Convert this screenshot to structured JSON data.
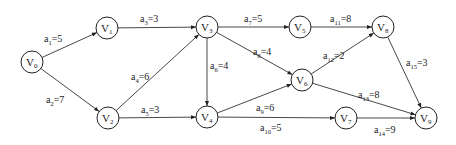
{
  "diagram": {
    "type": "aoe-network",
    "node_radius": 11,
    "colors": {
      "stroke": "#222222",
      "background": "#ffffff",
      "text": "#222222"
    },
    "nodes": [
      {
        "id": "V0",
        "base": "V",
        "sub": "0",
        "x": 32,
        "y": 62
      },
      {
        "id": "V1",
        "base": "V",
        "sub": "1",
        "x": 107,
        "y": 28
      },
      {
        "id": "V2",
        "base": "V",
        "sub": "2",
        "x": 108,
        "y": 118
      },
      {
        "id": "V3",
        "base": "V",
        "sub": "3",
        "x": 207,
        "y": 27
      },
      {
        "id": "V4",
        "base": "V",
        "sub": "4",
        "x": 207,
        "y": 117
      },
      {
        "id": "V5",
        "base": "V",
        "sub": "5",
        "x": 300,
        "y": 27
      },
      {
        "id": "V6",
        "base": "V",
        "sub": "6",
        "x": 302,
        "y": 80
      },
      {
        "id": "V7",
        "base": "V",
        "sub": "7",
        "x": 346,
        "y": 118
      },
      {
        "id": "V8",
        "base": "V",
        "sub": "8",
        "x": 383,
        "y": 27
      },
      {
        "id": "V9",
        "base": "V",
        "sub": "9",
        "x": 426,
        "y": 118
      }
    ],
    "edges": [
      {
        "from": "V0",
        "to": "V1",
        "base": "a",
        "sub": "1",
        "value": "5",
        "lx": 44,
        "ly": 42
      },
      {
        "from": "V0",
        "to": "V2",
        "base": "a",
        "sub": "2",
        "value": "7",
        "lx": 46,
        "ly": 103
      },
      {
        "from": "V1",
        "to": "V3",
        "base": "a",
        "sub": "3",
        "value": "3",
        "lx": 140,
        "ly": 22
      },
      {
        "from": "V2",
        "to": "V3",
        "base": "a",
        "sub": "4",
        "value": "6",
        "lx": 131,
        "ly": 80
      },
      {
        "from": "V2",
        "to": "V4",
        "base": "a",
        "sub": "5",
        "value": "3",
        "lx": 141,
        "ly": 113
      },
      {
        "from": "V3",
        "to": "V4",
        "base": "a",
        "sub": "6",
        "value": "4",
        "lx": 210,
        "ly": 69
      },
      {
        "from": "V3",
        "to": "V5",
        "base": "a",
        "sub": "7",
        "value": "5",
        "lx": 244,
        "ly": 22
      },
      {
        "from": "V3",
        "to": "V6",
        "base": "a",
        "sub": "8",
        "value": "4",
        "lx": 253,
        "ly": 55
      },
      {
        "from": "V4",
        "to": "V6",
        "base": "a",
        "sub": "9",
        "value": "6",
        "lx": 256,
        "ly": 111
      },
      {
        "from": "V4",
        "to": "V7",
        "base": "a",
        "sub": "10",
        "value": "5",
        "lx": 260,
        "ly": 131
      },
      {
        "from": "V5",
        "to": "V8",
        "base": "a",
        "sub": "11",
        "value": "8",
        "lx": 330,
        "ly": 22
      },
      {
        "from": "V6",
        "to": "V8",
        "base": "a",
        "sub": "12",
        "value": "2",
        "lx": 323,
        "ly": 59
      },
      {
        "from": "V6",
        "to": "V9",
        "base": "a",
        "sub": "13",
        "value": "8",
        "lx": 358,
        "ly": 98
      },
      {
        "from": "V7",
        "to": "V9",
        "base": "a",
        "sub": "14",
        "value": "9",
        "lx": 374,
        "ly": 133
      },
      {
        "from": "V8",
        "to": "V9",
        "base": "a",
        "sub": "15",
        "value": "3",
        "lx": 406,
        "ly": 66
      }
    ]
  }
}
